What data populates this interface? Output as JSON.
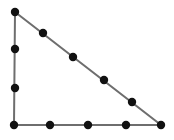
{
  "diagram": {
    "type": "right-triangle-dot-pattern",
    "background": "#ffffff",
    "edge_color": "#6e6e6e",
    "dot_color": "#111111",
    "edge_width": 2,
    "dot_radius": 4.2,
    "vertices": [
      {
        "name": "top",
        "x": 15,
        "y": 12
      },
      {
        "name": "bottom-left",
        "x": 14,
        "y": 125
      },
      {
        "name": "bottom-right",
        "x": 161,
        "y": 125
      }
    ],
    "dots": [
      {
        "x": 15,
        "y": 12
      },
      {
        "x": 43,
        "y": 33
      },
      {
        "x": 73,
        "y": 57
      },
      {
        "x": 104,
        "y": 80
      },
      {
        "x": 132,
        "y": 102
      },
      {
        "x": 161,
        "y": 125
      },
      {
        "x": 126,
        "y": 125
      },
      {
        "x": 88,
        "y": 125
      },
      {
        "x": 50,
        "y": 125
      },
      {
        "x": 14,
        "y": 125
      },
      {
        "x": 15,
        "y": 88
      },
      {
        "x": 15,
        "y": 49
      }
    ],
    "dot_counts": {
      "left_side": 4,
      "bottom_side": 5,
      "hypotenuse": 6,
      "total": 12
    }
  }
}
